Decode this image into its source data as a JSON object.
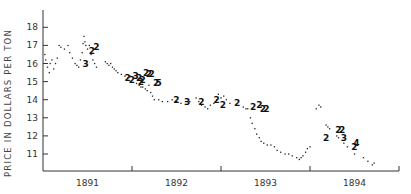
{
  "chart_data": {
    "type": "scatter",
    "title": "",
    "xlabel": "",
    "ylabel": "PRICE IN DOLLARS PER TON",
    "ylim": [
      10,
      19
    ],
    "yticks": [
      11,
      12,
      13,
      14,
      15,
      16,
      17,
      18
    ],
    "xlim": [
      1891.0,
      1895.0
    ],
    "xtick_boundaries": [
      1892.0,
      1893.0,
      1894.0,
      1895.0
    ],
    "x_category_labels": [
      {
        "label": "1891",
        "center": 1891.5
      },
      {
        "label": "1892",
        "center": 1892.5
      },
      {
        "label": "1893",
        "center": 1893.5
      },
      {
        "label": "1894",
        "center": 1894.5
      }
    ],
    "grid": false,
    "legend": null,
    "series": [
      {
        "name": "price observations (dots)",
        "points": [
          [
            1891.02,
            16.5
          ],
          [
            1891.03,
            16.2
          ],
          [
            1891.05,
            15.8
          ],
          [
            1891.07,
            15.5
          ],
          [
            1891.08,
            16.0
          ],
          [
            1891.1,
            16.2
          ],
          [
            1891.12,
            15.7
          ],
          [
            1891.14,
            16.0
          ],
          [
            1891.16,
            16.3
          ],
          [
            1891.18,
            17.0
          ],
          [
            1891.2,
            16.9
          ],
          [
            1891.24,
            16.8
          ],
          [
            1891.28,
            17.0
          ],
          [
            1891.3,
            16.6
          ],
          [
            1891.33,
            16.3
          ],
          [
            1891.36,
            16.0
          ],
          [
            1891.38,
            15.9
          ],
          [
            1891.4,
            15.8
          ],
          [
            1891.42,
            16.2
          ],
          [
            1891.44,
            16.6
          ],
          [
            1891.45,
            17.1
          ],
          [
            1891.46,
            17.5
          ],
          [
            1891.47,
            17.2
          ],
          [
            1891.48,
            17.0
          ],
          [
            1891.5,
            16.8
          ],
          [
            1891.52,
            17.0
          ],
          [
            1891.54,
            16.5
          ],
          [
            1891.56,
            16.2
          ],
          [
            1891.58,
            16.0
          ],
          [
            1891.6,
            15.8
          ],
          [
            1891.7,
            16.1
          ],
          [
            1891.72,
            16.0
          ],
          [
            1891.74,
            15.9
          ],
          [
            1891.76,
            16.0
          ],
          [
            1891.78,
            15.8
          ],
          [
            1891.8,
            15.7
          ],
          [
            1891.82,
            15.6
          ],
          [
            1891.84,
            15.5
          ],
          [
            1891.88,
            15.4
          ],
          [
            1891.92,
            15.3
          ],
          [
            1891.95,
            15.2
          ],
          [
            1891.98,
            15.3
          ],
          [
            1892.05,
            14.9
          ],
          [
            1892.08,
            14.8
          ],
          [
            1892.1,
            14.7
          ],
          [
            1892.12,
            14.7
          ],
          [
            1892.15,
            14.6
          ],
          [
            1892.17,
            14.5
          ],
          [
            1892.19,
            14.8
          ],
          [
            1892.21,
            14.4
          ],
          [
            1892.23,
            14.2
          ],
          [
            1892.25,
            14.0
          ],
          [
            1892.3,
            14.0
          ],
          [
            1892.34,
            13.9
          ],
          [
            1892.4,
            13.9
          ],
          [
            1892.45,
            14.0
          ],
          [
            1892.5,
            13.9
          ],
          [
            1892.55,
            13.8
          ],
          [
            1892.6,
            13.9
          ],
          [
            1892.65,
            13.9
          ],
          [
            1892.72,
            14.1
          ],
          [
            1892.75,
            13.9
          ],
          [
            1892.78,
            13.7
          ],
          [
            1892.82,
            13.6
          ],
          [
            1892.85,
            13.5
          ],
          [
            1892.88,
            13.7
          ],
          [
            1892.92,
            13.8
          ],
          [
            1892.95,
            14.0
          ],
          [
            1892.97,
            14.3
          ],
          [
            1893.0,
            14.1
          ],
          [
            1893.03,
            14.2
          ],
          [
            1893.06,
            14.0
          ],
          [
            1893.1,
            13.8
          ],
          [
            1893.25,
            13.6
          ],
          [
            1893.28,
            13.5
          ],
          [
            1893.3,
            13.5
          ],
          [
            1893.33,
            13.0
          ],
          [
            1893.35,
            12.7
          ],
          [
            1893.38,
            12.4
          ],
          [
            1893.4,
            12.1
          ],
          [
            1893.43,
            11.9
          ],
          [
            1893.45,
            11.7
          ],
          [
            1893.48,
            11.6
          ],
          [
            1893.52,
            11.5
          ],
          [
            1893.56,
            11.5
          ],
          [
            1893.6,
            11.4
          ],
          [
            1893.63,
            11.2
          ],
          [
            1893.67,
            11.1
          ],
          [
            1893.72,
            11.0
          ],
          [
            1893.76,
            11.0
          ],
          [
            1893.8,
            10.9
          ],
          [
            1893.85,
            10.8
          ],
          [
            1893.88,
            10.7
          ],
          [
            1893.9,
            10.8
          ],
          [
            1893.92,
            10.9
          ],
          [
            1893.95,
            11.1
          ],
          [
            1893.97,
            11.3
          ],
          [
            1894.0,
            11.4
          ],
          [
            1894.07,
            13.5
          ],
          [
            1894.1,
            13.7
          ],
          [
            1894.12,
            13.6
          ],
          [
            1894.18,
            12.6
          ],
          [
            1894.2,
            12.5
          ],
          [
            1894.22,
            12.4
          ],
          [
            1894.3,
            12.0
          ],
          [
            1894.32,
            11.9
          ],
          [
            1894.38,
            11.6
          ],
          [
            1894.42,
            11.4
          ],
          [
            1894.5,
            11.0
          ],
          [
            1894.6,
            10.8
          ],
          [
            1894.65,
            10.6
          ],
          [
            1894.7,
            10.4
          ],
          [
            1894.72,
            10.5
          ]
        ]
      },
      {
        "name": "multiple observations (numeric markers)",
        "markers": [
          {
            "x": 1891.48,
            "y": 16.0,
            "label": "3"
          },
          {
            "x": 1891.55,
            "y": 16.7,
            "label": "2"
          },
          {
            "x": 1891.6,
            "y": 16.9,
            "label": "2"
          },
          {
            "x": 1891.95,
            "y": 15.2,
            "label": "2"
          },
          {
            "x": 1892.0,
            "y": 15.1,
            "label": "2"
          },
          {
            "x": 1892.04,
            "y": 15.3,
            "label": "3"
          },
          {
            "x": 1892.08,
            "y": 15.2,
            "label": "2"
          },
          {
            "x": 1892.1,
            "y": 15.0,
            "label": "2"
          },
          {
            "x": 1892.12,
            "y": 15.1,
            "label": "2"
          },
          {
            "x": 1892.16,
            "y": 15.5,
            "label": "2"
          },
          {
            "x": 1892.19,
            "y": 15.4,
            "label": "2"
          },
          {
            "x": 1892.22,
            "y": 15.4,
            "label": "2"
          },
          {
            "x": 1892.27,
            "y": 14.9,
            "label": "2"
          },
          {
            "x": 1892.3,
            "y": 14.9,
            "label": "5"
          },
          {
            "x": 1892.5,
            "y": 14.0,
            "label": "2"
          },
          {
            "x": 1892.62,
            "y": 13.9,
            "label": "3"
          },
          {
            "x": 1892.78,
            "y": 13.9,
            "label": "2"
          },
          {
            "x": 1892.95,
            "y": 14.0,
            "label": "2"
          },
          {
            "x": 1893.02,
            "y": 13.7,
            "label": "2"
          },
          {
            "x": 1893.18,
            "y": 13.8,
            "label": "2"
          },
          {
            "x": 1893.36,
            "y": 13.6,
            "label": "2"
          },
          {
            "x": 1893.43,
            "y": 13.7,
            "label": "2"
          },
          {
            "x": 1893.47,
            "y": 13.5,
            "label": "2"
          },
          {
            "x": 1893.51,
            "y": 13.5,
            "label": "2"
          },
          {
            "x": 1894.18,
            "y": 11.9,
            "label": "2"
          },
          {
            "x": 1894.32,
            "y": 12.3,
            "label": "2"
          },
          {
            "x": 1894.36,
            "y": 12.3,
            "label": "2"
          },
          {
            "x": 1894.38,
            "y": 11.9,
            "label": "3"
          },
          {
            "x": 1894.5,
            "y": 11.4,
            "label": "2"
          },
          {
            "x": 1894.52,
            "y": 11.6,
            "label": "4"
          }
        ]
      }
    ]
  },
  "axes": {
    "ylabel": "PRICE IN DOLLARS PER TON",
    "ytick_labels": [
      "11",
      "12",
      "13",
      "14",
      "15",
      "16",
      "17",
      "18"
    ],
    "xtick_labels": [
      "1891",
      "1892",
      "1893",
      "1894"
    ]
  },
  "colors": {
    "ink": "#222222",
    "axis": "#333333",
    "background": "#ffffff"
  }
}
